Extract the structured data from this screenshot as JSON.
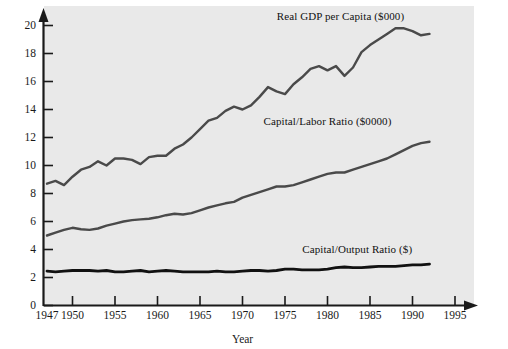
{
  "chart_data": {
    "type": "line",
    "title": "",
    "xlabel": "Year",
    "ylabel": "",
    "xlim": [
      1947,
      1996
    ],
    "ylim": [
      0,
      21
    ],
    "grid": false,
    "legend_position": "inline-annotations",
    "xticks": [
      "1947",
      "1950",
      "1955",
      "1960",
      "1965",
      "1970",
      "1975",
      "1980",
      "1985",
      "1990",
      "1995"
    ],
    "xtick_values": [
      1947,
      1950,
      1955,
      1960,
      1965,
      1970,
      1975,
      1980,
      1985,
      1990,
      1995
    ],
    "yticks": [
      "0",
      "2",
      "4",
      "6",
      "8",
      "10",
      "12",
      "14",
      "16",
      "18",
      "20"
    ],
    "ytick_values": [
      0,
      2,
      4,
      6,
      8,
      10,
      12,
      14,
      16,
      18,
      20
    ],
    "x": [
      1947,
      1948,
      1949,
      1950,
      1951,
      1952,
      1953,
      1954,
      1955,
      1956,
      1957,
      1958,
      1959,
      1960,
      1961,
      1962,
      1963,
      1964,
      1965,
      1966,
      1967,
      1968,
      1969,
      1970,
      1971,
      1972,
      1973,
      1974,
      1975,
      1976,
      1977,
      1978,
      1979,
      1980,
      1981,
      1982,
      1983,
      1984,
      1985,
      1986,
      1987,
      1988,
      1989,
      1990,
      1991,
      1992
    ],
    "series": [
      {
        "name": "Real GDP per Capita ($000)",
        "units": "$000",
        "color": "#4a4a4a",
        "label_x": 1981.5,
        "label_y": 20.6,
        "values": [
          8.7,
          8.9,
          8.6,
          9.2,
          9.7,
          9.9,
          10.3,
          10.0,
          10.5,
          10.5,
          10.4,
          10.1,
          10.6,
          10.7,
          10.7,
          11.2,
          11.5,
          12.0,
          12.6,
          13.2,
          13.4,
          13.9,
          14.2,
          14.0,
          14.3,
          14.9,
          15.6,
          15.3,
          15.1,
          15.8,
          16.3,
          16.9,
          17.1,
          16.8,
          17.1,
          16.4,
          17.0,
          18.1,
          18.6,
          19.0,
          19.4,
          19.8,
          19.8,
          19.6,
          19.3,
          19.4
        ]
      },
      {
        "name": "Capital/Labor Ratio ($0000)",
        "units": "$0000",
        "color": "#4a4a4a",
        "label_x": 1980.0,
        "label_y": 13.1,
        "values": [
          5.0,
          5.2,
          5.4,
          5.55,
          5.45,
          5.4,
          5.5,
          5.7,
          5.85,
          6.0,
          6.1,
          6.15,
          6.2,
          6.3,
          6.45,
          6.55,
          6.5,
          6.6,
          6.8,
          7.0,
          7.15,
          7.3,
          7.4,
          7.7,
          7.9,
          8.1,
          8.3,
          8.5,
          8.5,
          8.6,
          8.8,
          9.0,
          9.2,
          9.4,
          9.5,
          9.5,
          9.7,
          9.9,
          10.1,
          10.3,
          10.5,
          10.8,
          11.1,
          11.4,
          11.6,
          11.7
        ]
      },
      {
        "name": "Capital/Output Ratio ($)",
        "units": "$",
        "color": "#111111",
        "label_x": 1983.5,
        "label_y": 4.0,
        "values": [
          2.45,
          2.4,
          2.45,
          2.5,
          2.5,
          2.5,
          2.45,
          2.5,
          2.4,
          2.4,
          2.45,
          2.5,
          2.4,
          2.45,
          2.5,
          2.45,
          2.4,
          2.4,
          2.4,
          2.4,
          2.45,
          2.4,
          2.4,
          2.45,
          2.5,
          2.5,
          2.45,
          2.5,
          2.6,
          2.6,
          2.55,
          2.55,
          2.55,
          2.6,
          2.7,
          2.75,
          2.7,
          2.7,
          2.75,
          2.8,
          2.8,
          2.8,
          2.85,
          2.9,
          2.9,
          2.95
        ]
      }
    ]
  },
  "axis": {
    "x_title": "Year"
  },
  "colors": {
    "plot_background": "#e9e9e9",
    "page_background": "#ffffff",
    "axis": "#1a1a1a",
    "gdp_line": "#4a4a4a",
    "capital_labor_line": "#4a4a4a",
    "capital_output_line": "#111111"
  }
}
